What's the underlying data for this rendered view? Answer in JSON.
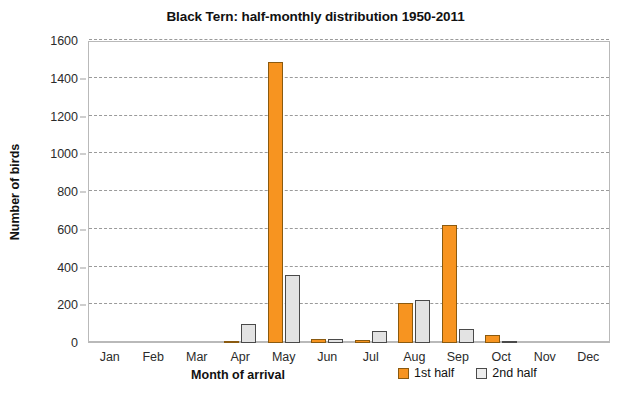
{
  "chart_data": {
    "type": "bar",
    "title": "Black Tern: half-monthly distribution 1950-2011",
    "xlabel": "Month of arrival",
    "ylabel": "Number of birds",
    "categories": [
      "Jan",
      "Feb",
      "Mar",
      "Apr",
      "May",
      "Jun",
      "Jul",
      "Aug",
      "Sep",
      "Oct",
      "Nov",
      "Dec"
    ],
    "series": [
      {
        "name": "1st half",
        "color": "#f79420",
        "values": [
          0,
          0,
          0,
          3,
          1490,
          22,
          14,
          210,
          625,
          45,
          0,
          0
        ]
      },
      {
        "name": "2nd half",
        "color": "#e3e3e3",
        "values": [
          0,
          0,
          0,
          100,
          360,
          20,
          65,
          228,
          72,
          5,
          0,
          0
        ]
      }
    ],
    "ylim": [
      0,
      1600
    ],
    "yticks": [
      0,
      200,
      400,
      600,
      800,
      1000,
      1200,
      1400,
      1600
    ],
    "grid": true,
    "legend_position": "bottom-right"
  }
}
